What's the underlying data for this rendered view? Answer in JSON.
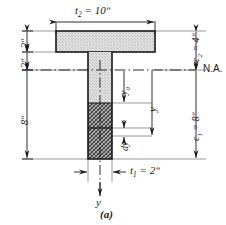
{
  "figure": {
    "caption": "(a)",
    "neutral_axis_label": "N.A.",
    "dimensions": {
      "flange_width": "t",
      "flange_width_sub": "2",
      "flange_width_value": " = 10ʺ",
      "stem_width": "t",
      "stem_width_sub": "1",
      "stem_width_value": " = 2ʺ",
      "flange_thickness": "2ʺ",
      "flange_to_na": "2ʺ",
      "stem_depth": "8ʺ",
      "c2_label": "c",
      "c2_sub": "2",
      "c2_value": " = 4ʺ",
      "c1_label": "c",
      "c1_sub": "1",
      "c1_value": " = 8ʺ"
    },
    "variables": {
      "y_zero": "y",
      "y_zero_sub": "0",
      "y_bar": "y",
      "dy": "dy",
      "axis_y": "y"
    },
    "colors": {
      "line": "#1a1a1a",
      "flange_fill": "#d9d9d9",
      "hatch_fill": "#8a8a8a",
      "thin_line": "#555555",
      "background": "#ffffff"
    }
  }
}
